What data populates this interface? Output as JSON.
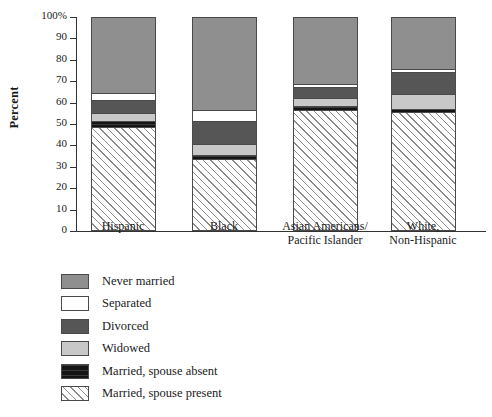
{
  "chart_data": {
    "type": "bar",
    "subtype": "stacked-percent",
    "title": "",
    "xlabel": "",
    "ylabel": "Percent",
    "ylim": [
      0,
      100
    ],
    "grid": false,
    "legend_position": "bottom-left",
    "categories": [
      "Hispanic",
      "Black",
      "Asian Americans/\nPacific Islander",
      "White,\nNon-Hispanic"
    ],
    "category_lines": [
      [
        "Hispanic",
        ""
      ],
      [
        "Black",
        ""
      ],
      [
        "Asian Americans/",
        "Pacific Islander"
      ],
      [
        "White,",
        "Non-Hispanic"
      ]
    ],
    "ytick_labels": [
      "100%",
      "90",
      "80",
      "70",
      "60",
      "50",
      "40",
      "30",
      "20",
      "10",
      "0"
    ],
    "ytick_values": [
      100,
      90,
      80,
      70,
      60,
      50,
      40,
      30,
      20,
      10,
      0
    ],
    "series": [
      {
        "name": "Married, spouse present",
        "pattern": "diagonal-hatch",
        "color": "#ffffff",
        "values": [
          48,
          33,
          56,
          55
        ]
      },
      {
        "name": "Married, spouse absent",
        "pattern": "solid-black",
        "color": "#151515",
        "values": [
          3,
          2,
          2,
          1.5
        ]
      },
      {
        "name": "Widowed",
        "pattern": "solid",
        "color": "#c8c8c8",
        "values": [
          3.5,
          5,
          4,
          7
        ]
      },
      {
        "name": "Divorced",
        "pattern": "solid",
        "color": "#565656",
        "values": [
          6.5,
          11,
          5,
          10.5
        ]
      },
      {
        "name": "Separated",
        "pattern": "solid",
        "color": "#ffffff",
        "values": [
          3,
          5,
          1.5,
          1.5
        ]
      },
      {
        "name": "Never married",
        "pattern": "solid",
        "color": "#8f8f8f",
        "values": [
          36,
          44,
          31.5,
          24.5
        ]
      }
    ],
    "legend_entries": [
      {
        "label": "Never married",
        "swatch": "#8f8f8f",
        "pattern": "solid"
      },
      {
        "label": "Separated",
        "swatch": "#ffffff",
        "pattern": "solid"
      },
      {
        "label": "Divorced",
        "swatch": "#565656",
        "pattern": "solid"
      },
      {
        "label": "Widowed",
        "swatch": "#c8c8c8",
        "pattern": "solid"
      },
      {
        "label": "Married, spouse absent",
        "swatch": "#151515",
        "pattern": "solid-black"
      },
      {
        "label": "Married, spouse present",
        "swatch": "#ffffff",
        "pattern": "diagonal-hatch"
      }
    ]
  }
}
